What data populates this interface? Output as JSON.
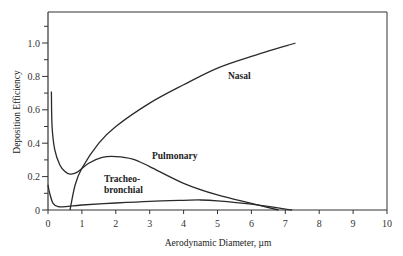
{
  "chart_data": {
    "type": "line",
    "title": "",
    "xlabel": "Aerodynamic Diameter, µm",
    "ylabel": "Deposition Efficiency",
    "xlim": [
      0,
      10
    ],
    "ylim": [
      0,
      1.15
    ],
    "x_ticks": [
      "0",
      "1",
      "2",
      "3",
      "4",
      "5",
      "6",
      "7",
      "8",
      "9",
      "10"
    ],
    "y_ticks": [
      "0",
      "0.2",
      "0.4",
      "0.6",
      "0.8",
      "1.0"
    ],
    "grid": false,
    "legend": "inline labels",
    "series": [
      {
        "name": "Nasal",
        "x": [
          0.65,
          0.8,
          1.0,
          1.5,
          2.0,
          3.0,
          4.0,
          5.0,
          6.0,
          7.3
        ],
        "y": [
          0.0,
          0.15,
          0.25,
          0.4,
          0.5,
          0.64,
          0.75,
          0.85,
          0.92,
          1.0
        ]
      },
      {
        "name": "Pulmonary",
        "x": [
          0.1,
          0.12,
          0.2,
          0.35,
          0.5,
          0.65,
          0.85,
          1.2,
          1.6,
          2.0,
          2.5,
          3.0,
          4.0,
          5.0,
          6.0,
          6.8
        ],
        "y": [
          0.71,
          0.5,
          0.36,
          0.27,
          0.23,
          0.215,
          0.225,
          0.28,
          0.315,
          0.32,
          0.305,
          0.26,
          0.16,
          0.09,
          0.04,
          0.0
        ]
      },
      {
        "name": "Tracheo-bronchial",
        "x": [
          0.0,
          0.05,
          0.15,
          0.3,
          0.6,
          1.0,
          2.0,
          3.0,
          4.0,
          4.5,
          5.0,
          6.0,
          7.2
        ],
        "y": [
          0.15,
          0.1,
          0.04,
          0.02,
          0.022,
          0.03,
          0.042,
          0.052,
          0.058,
          0.06,
          0.055,
          0.035,
          0.0
        ]
      }
    ],
    "annotations": [
      {
        "text": "Nasal",
        "x": 5.3,
        "y": 0.8
      },
      {
        "text": "Pulmonary",
        "x": 3.0,
        "y": 0.38
      },
      {
        "text": "Tracheo-",
        "x": 1.7,
        "y": 0.22
      },
      {
        "text": "bronchial",
        "x": 1.7,
        "y": 0.15
      }
    ]
  },
  "labels": {
    "xlabel": "Aerodynamic Diameter, µm",
    "ylabel": "Deposition Efficiency",
    "nasal": "Nasal",
    "pulmonary": "Pulmonary",
    "tracheo1": "Tracheo-",
    "tracheo2": "bronchial"
  }
}
